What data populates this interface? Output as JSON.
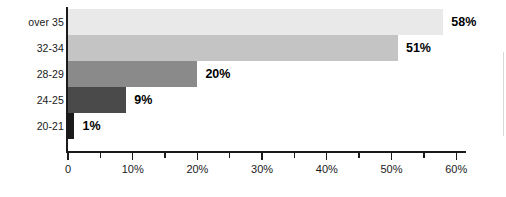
{
  "chart_data": {
    "type": "bar",
    "orientation": "horizontal",
    "title": "",
    "xlabel": "",
    "ylabel": "",
    "categories": [
      "20-21",
      "24-25",
      "28-29",
      "32-34",
      "over 35"
    ],
    "values": [
      1,
      9,
      20,
      51,
      58
    ],
    "value_labels": [
      "1%",
      "9%",
      "20%",
      "51%",
      "58%"
    ],
    "bar_colors": [
      "#1a1a1a",
      "#4a4a4a",
      "#8a8a8a",
      "#c4c4c4",
      "#e9e9e9"
    ],
    "xlim": [
      0,
      62
    ],
    "x_ticks": [
      0,
      5,
      10,
      15,
      20,
      25,
      30,
      35,
      40,
      45,
      50,
      55,
      60
    ],
    "x_tick_labels": [
      "0",
      "",
      "10%",
      "",
      "20%",
      "",
      "30%",
      "",
      "40%",
      "",
      "50%",
      "",
      "60%"
    ],
    "x_major_ticks": [
      0,
      10,
      20,
      30,
      40,
      50,
      60
    ],
    "grid": false,
    "legend": false
  },
  "axis": {
    "tick_labels": [
      {
        "value": 0,
        "label": "0",
        "major": true
      },
      {
        "value": 5,
        "label": "",
        "major": false
      },
      {
        "value": 10,
        "label": "10%",
        "major": true
      },
      {
        "value": 15,
        "label": "",
        "major": false
      },
      {
        "value": 20,
        "label": "20%",
        "major": true
      },
      {
        "value": 25,
        "label": "",
        "major": false
      },
      {
        "value": 30,
        "label": "30%",
        "major": true
      },
      {
        "value": 35,
        "label": "",
        "major": false
      },
      {
        "value": 40,
        "label": "40%",
        "major": true
      },
      {
        "value": 45,
        "label": "",
        "major": false
      },
      {
        "value": 50,
        "label": "50%",
        "major": true
      },
      {
        "value": 55,
        "label": "",
        "major": false
      },
      {
        "value": 60,
        "label": "60%",
        "major": true
      }
    ]
  },
  "rows": [
    {
      "category": "over 35",
      "value": 58,
      "value_label": "58%",
      "color": "#e9e9e9"
    },
    {
      "category": "32-34",
      "value": 51,
      "value_label": "51%",
      "color": "#c4c4c4"
    },
    {
      "category": "28-29",
      "value": 20,
      "value_label": "20%",
      "color": "#8a8a8a"
    },
    {
      "category": "24-25",
      "value": 9,
      "value_label": "9%",
      "color": "#4a4a4a"
    },
    {
      "category": "20-21",
      "value": 1,
      "value_label": "1%",
      "color": "#1a1a1a"
    }
  ]
}
